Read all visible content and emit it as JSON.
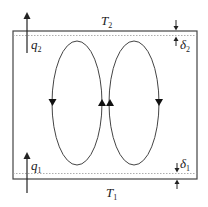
{
  "diagram": {
    "type": "convection-cell schematic",
    "labels": {
      "top_temperature": {
        "symbol": "T",
        "sub": "2"
      },
      "bottom_temperature": {
        "symbol": "T",
        "sub": "1"
      },
      "top_heat_flux": {
        "symbol": "q",
        "sub": "2"
      },
      "bottom_heat_flux": {
        "symbol": "q",
        "sub": "1"
      },
      "top_boundary_layer": {
        "symbol": "δ",
        "sub": "2"
      },
      "bottom_boundary_layer": {
        "symbol": "δ",
        "sub": "1"
      }
    },
    "cells": [
      {
        "name": "left-cell",
        "rotation": "counterclockwise"
      },
      {
        "name": "right-cell",
        "rotation": "clockwise"
      }
    ],
    "colors": {
      "line": "#333333",
      "dotted": "#999999",
      "background": "#ffffff"
    }
  }
}
